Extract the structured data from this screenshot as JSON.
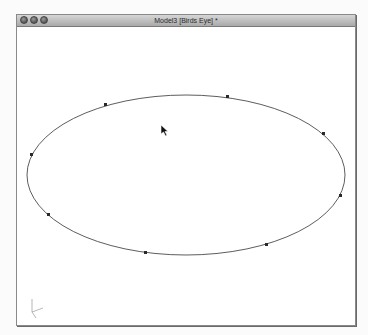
{
  "window": {
    "title": "Model3 [Birds Eye] *",
    "buttons": [
      {
        "name": "close",
        "icon": "close-icon"
      },
      {
        "name": "minimize",
        "icon": "minimize-icon"
      },
      {
        "name": "zoom",
        "icon": "zoom-icon"
      }
    ]
  },
  "viewport": {
    "view": "Birds Eye",
    "shape": "ellipse",
    "control_point_count": 8,
    "axes_gizmo": {
      "labels": [
        "Y",
        "X",
        "Z"
      ]
    },
    "cursor": "arrow-pointer",
    "colors": {
      "curve": "#333333",
      "control_point": "#2a2a2a",
      "background": "#ffffff"
    }
  }
}
